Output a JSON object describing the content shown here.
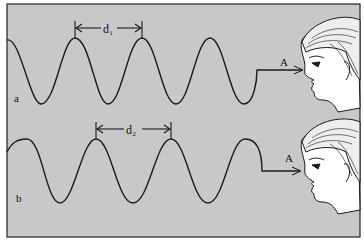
{
  "panels": [
    {
      "id": "a",
      "label": "a",
      "distance_label": "d₁",
      "point_label": "A"
    },
    {
      "id": "b",
      "label": "b",
      "distance_label": "d₂",
      "point_label": "A"
    }
  ],
  "colors": {
    "background": "#c8c8c8",
    "line": "#1a1a1a",
    "face": "#ffffff"
  }
}
